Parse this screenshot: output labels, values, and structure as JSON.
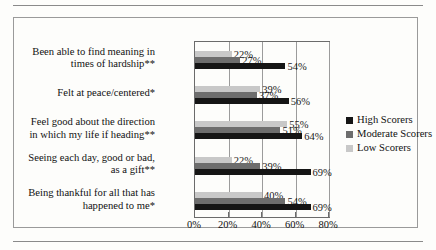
{
  "chart_data": {
    "type": "bar",
    "orientation": "horizontal",
    "title": "",
    "xlabel": "",
    "ylabel": "",
    "xlim": [
      0,
      80
    ],
    "xticks": [
      "0%",
      "20%",
      "40%",
      "60%",
      "80%"
    ],
    "xtick_values": [
      0,
      20,
      40,
      60,
      80
    ],
    "grid": true,
    "legend_position": "right",
    "categories": [
      "Been able to find meaning in times of hardship**",
      "Felt at peace/centered*",
      "Feel good about the direction in which my life if heading**",
      "Seeing each day, good or bad, as a gift**",
      "Being thankful for all that has happened to me*"
    ],
    "category_lines": [
      [
        "Been able to find meaning in",
        "times of hardship**"
      ],
      [
        "Felt at peace/centered*"
      ],
      [
        "Feel good about the direction",
        "in which my life if heading**"
      ],
      [
        "Seeing each day, good or bad,",
        "as a gift**"
      ],
      [
        "Being thankful for all that has",
        "happened to me*"
      ]
    ],
    "series": [
      {
        "name": "High Scorers",
        "color": "#151515",
        "values": [
          54,
          56,
          64,
          69,
          69
        ],
        "labels": [
          "54%",
          "56%",
          "64%",
          "69%",
          "69%"
        ]
      },
      {
        "name": "Moderate Scorers",
        "color": "#6d6d6d",
        "values": [
          27,
          37,
          51,
          39,
          54
        ],
        "labels": [
          "27%",
          "37%",
          "51%",
          "39%",
          "54%"
        ]
      },
      {
        "name": "Low Scorers",
        "color": "#c8c8c8",
        "values": [
          22,
          39,
          55,
          22,
          40
        ],
        "labels": [
          "22%",
          "39%",
          "55%",
          "22%",
          "40%"
        ]
      }
    ]
  },
  "legend": {
    "items": [
      {
        "label": "High Scorers",
        "color": "#151515"
      },
      {
        "label": "Moderate Scorers",
        "color": "#6d6d6d"
      },
      {
        "label": "Low Scorers",
        "color": "#c8c8c8"
      }
    ]
  }
}
